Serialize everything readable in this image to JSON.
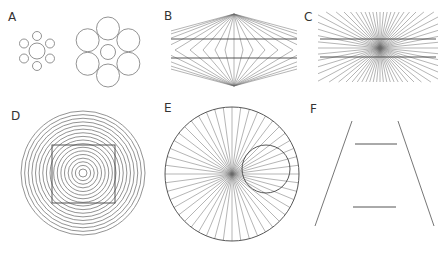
{
  "figure": {
    "panels": [
      {
        "id": "A",
        "label": "A",
        "label_pos": [
          8,
          21
        ],
        "type": "ebbinghaus",
        "groups": [
          {
            "center": [
              37,
              51
            ],
            "center_r": 8,
            "surround_r": 4.5,
            "surround_dist": 15,
            "count": 6,
            "start_angle": -90
          },
          {
            "center": [
              108,
              52
            ],
            "center_r": 7.5,
            "surround_r": 11.5,
            "surround_dist": 23.5,
            "count": 6,
            "start_angle": -90
          }
        ]
      },
      {
        "id": "B",
        "label": "B",
        "label_pos": [
          164,
          20
        ],
        "type": "hering",
        "apex_top": [
          234,
          14
        ],
        "apex_bottom": [
          234,
          86
        ],
        "mid_y": 50,
        "x_min": 171,
        "x_max": 297,
        "fan_x": [
          100,
          120,
          140,
          160,
          175,
          190,
          203,
          215,
          225,
          234,
          243,
          253,
          265,
          278,
          293,
          308,
          328,
          348,
          368
        ],
        "horizontals": [
          39,
          58
        ],
        "line_color": "#5a5a5a"
      },
      {
        "id": "C",
        "label": "C",
        "label_pos": [
          304,
          21
        ],
        "type": "wundt-fan",
        "center": [
          380,
          48
        ],
        "box": [
          318,
          12,
          438,
          82
        ],
        "ray_count": 64,
        "horizontals": [
          39,
          57
        ],
        "line_color": "#6a6a6a"
      },
      {
        "id": "D",
        "label": "D",
        "label_pos": [
          11,
          120
        ],
        "type": "orbison-square",
        "center": [
          83,
          173
        ],
        "ring_count": 17,
        "r_min": 4,
        "r_max": 62,
        "square": [
          52,
          145,
          63,
          58
        ]
      },
      {
        "id": "E",
        "label": "E",
        "label_pos": [
          164,
          112
        ],
        "type": "orbison-circle",
        "center": [
          232,
          174
        ],
        "radius": 67,
        "ray_count": 48,
        "inner_circle": {
          "center": [
            266,
            169
          ],
          "r": 24
        }
      },
      {
        "id": "F",
        "label": "F",
        "label_pos": [
          310,
          113
        ],
        "type": "ponzo",
        "rails": [
          [
            352,
            121,
            315,
            226
          ],
          [
            398,
            121,
            434,
            226
          ]
        ],
        "bars": [
          [
            355,
            144,
            397,
            144
          ],
          [
            353,
            207,
            396,
            207
          ]
        ]
      }
    ]
  }
}
